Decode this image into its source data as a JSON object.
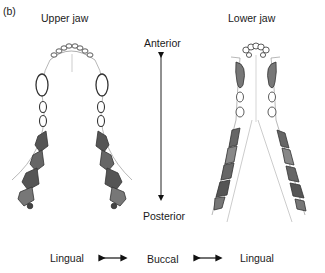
{
  "panel_label": "(b)",
  "titles": {
    "upper": "Upper jaw",
    "lower": "Lower jaw"
  },
  "axis": {
    "top": "Anterior",
    "bottom": "Posterior"
  },
  "bottom_row": {
    "left": "Lingual",
    "center": "Buccal",
    "right": "Lingual"
  }
}
